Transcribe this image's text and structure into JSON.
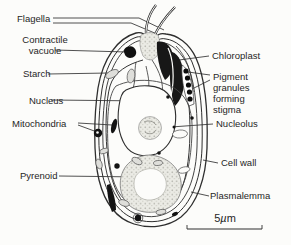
{
  "diagram": {
    "background": "#fcfcfa",
    "ink": "#262626",
    "labels": {
      "flagella": "Flagella",
      "contractile_vacuole": "Contractile\nvacuole",
      "starch": "Starch",
      "nucleus": "Nucleus",
      "mitochondria": "Mitochondria",
      "pyrenoid": "Pyrenoid",
      "chloroplast": "Chloroplast",
      "pigment_granules": "Pigment\ngranules\nforming\nstigma",
      "nucleolus": "Nucleolus",
      "cell_wall": "Cell wall",
      "plasmalemma": "Plasmalemma"
    },
    "scale_bar": {
      "value": "5",
      "mu": "µ",
      "unit": "m"
    }
  }
}
